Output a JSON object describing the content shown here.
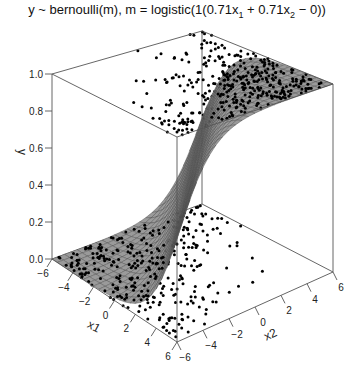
{
  "chart_data": {
    "type": "surface3d",
    "title_parts": {
      "prefix": "y ~ bernoulli(m), m = logistic(1(0.71x",
      "sub1": "1",
      "mid": " + 0.71x",
      "sub2": "2",
      "suffix": " − 0))"
    },
    "model": {
      "link": "logistic",
      "scale": 1,
      "w1": 0.71,
      "w2": 0.71,
      "bias": 0
    },
    "xlabel": "x1",
    "zlabel": "x2",
    "ylabel": "y",
    "x1_range": [
      -6,
      6
    ],
    "x2_range": [
      -6,
      6
    ],
    "y_range": [
      0,
      1
    ],
    "x1_ticks": [
      "-6",
      "-4",
      "-2",
      "0",
      "2",
      "4",
      "6"
    ],
    "x2_ticks": [
      "-6",
      "-4",
      "-2",
      "0",
      "2",
      "4",
      "6"
    ],
    "y_ticks": [
      "0.0",
      "0.2",
      "0.4",
      "0.6",
      "0.8",
      "1.0"
    ],
    "points": "binary outcomes y in {0,1} scattered over x1,x2 in [-6,6]; y=1 points cluster where 0.71x1+0.71x2>0, y=0 points where <0",
    "surface_color": "#9a9a9a",
    "point_color": "#000000",
    "grid": false
  }
}
